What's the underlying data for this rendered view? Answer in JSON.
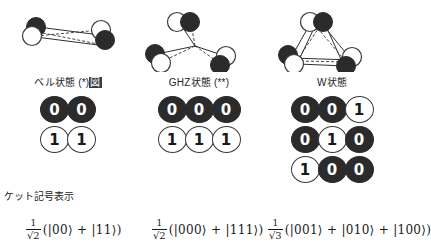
{
  "figure": {
    "ket_section_caption": "ケット記号表示"
  },
  "columns": [
    {
      "id": "bell",
      "label_text": "ベル状態 (*)",
      "label_highlight": "図",
      "diagram": {
        "name": "bell-pair-diagram",
        "qubit_count": 2,
        "arrangement": "two linked qubit pairs joined by solid and dashed bonds"
      },
      "bit_rows": [
        {
          "bits": [
            {
              "value": "0",
              "fill": "dark"
            },
            {
              "value": "0",
              "fill": "dark"
            }
          ]
        },
        {
          "bits": [
            {
              "value": "1",
              "fill": "light"
            },
            {
              "value": "1",
              "fill": "light"
            }
          ]
        }
      ],
      "formula": {
        "coefficient_numerator": "1",
        "coefficient_denominator": "√2",
        "expression": "(|00⟩ + |11⟩)"
      }
    },
    {
      "id": "ghz",
      "label_text": "GHZ状態 (**)",
      "label_highlight": "",
      "diagram": {
        "name": "ghz-star-diagram",
        "qubit_count": 3,
        "arrangement": "three qubit pairs radiating from a common center point"
      },
      "bit_rows": [
        {
          "bits": [
            {
              "value": "0",
              "fill": "dark"
            },
            {
              "value": "0",
              "fill": "dark"
            },
            {
              "value": "0",
              "fill": "dark"
            }
          ]
        },
        {
          "bits": [
            {
              "value": "1",
              "fill": "light"
            },
            {
              "value": "1",
              "fill": "light"
            },
            {
              "value": "1",
              "fill": "light"
            }
          ]
        }
      ],
      "formula": {
        "coefficient_numerator": "1",
        "coefficient_denominator": "√2",
        "expression": "(|000⟩ + |111⟩)"
      }
    },
    {
      "id": "w",
      "label_text": "W状態",
      "label_highlight": "",
      "diagram": {
        "name": "w-triangle-diagram",
        "qubit_count": 3,
        "arrangement": "three qubit pairs at triangle vertices fully interconnected"
      },
      "bit_rows": [
        {
          "bits": [
            {
              "value": "0",
              "fill": "dark"
            },
            {
              "value": "0",
              "fill": "dark"
            },
            {
              "value": "1",
              "fill": "light"
            }
          ]
        },
        {
          "bits": [
            {
              "value": "0",
              "fill": "dark"
            },
            {
              "value": "1",
              "fill": "light"
            },
            {
              "value": "0",
              "fill": "dark"
            }
          ]
        },
        {
          "bits": [
            {
              "value": "1",
              "fill": "light"
            },
            {
              "value": "0",
              "fill": "dark"
            },
            {
              "value": "0",
              "fill": "dark"
            }
          ]
        }
      ],
      "formula": {
        "coefficient_numerator": "1",
        "coefficient_denominator": "√3",
        "expression": "(|001⟩ + |010⟩ + |100⟩)"
      }
    }
  ],
  "colors": {
    "dark_qubit": "#2b2b2b",
    "light_qubit": "#ffffff",
    "stroke": "#3a3a3a",
    "text": "#1a1a1a",
    "highlight_bg": "#3a3a3a"
  }
}
